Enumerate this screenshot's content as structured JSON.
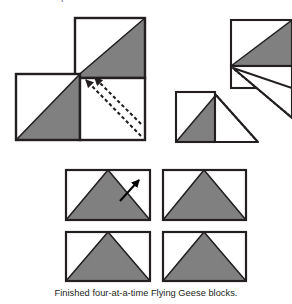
{
  "figure": {
    "top_instruction": "marked line and press seams toward as fabric A.",
    "caption": "Finished four-at-a-time Flying Geese blocks.",
    "colors": {
      "fabric_shaded": "#808080",
      "fabric_light": "#ffffff",
      "outline": "#231f20",
      "stitch_dash": "#231f20",
      "arrow": "#000000",
      "background": "#ffffff"
    },
    "labels": {
      "main_unit": "cut-apart pinwheel unit",
      "fold_unit_top": "folded geese unit upper right",
      "fold_unit_mid": "folded geese unit middle right",
      "block_1": "finished flying geese block 1",
      "block_2": "finished flying geese block 2",
      "block_3": "finished flying geese block 3",
      "block_4": "finished flying geese block 4",
      "cut_arrow_1": "cut direction arrow one",
      "cut_arrow_2": "cut direction arrow two",
      "press_arrow": "press direction arrow"
    }
  }
}
